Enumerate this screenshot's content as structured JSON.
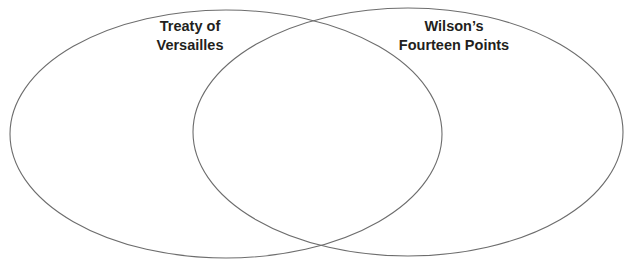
{
  "diagram": {
    "type": "venn",
    "stroke_color": "#6d6d6d",
    "sets": [
      {
        "id": "left",
        "label_lines": [
          "Treaty of",
          "Versailles"
        ]
      },
      {
        "id": "right",
        "label_lines": [
          "Wilson’s",
          "Fourteen Points"
        ]
      }
    ],
    "overlap_label": ""
  }
}
